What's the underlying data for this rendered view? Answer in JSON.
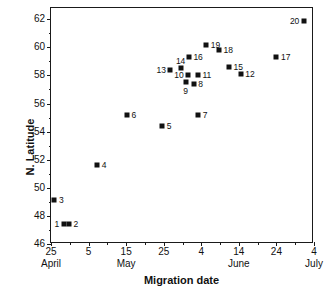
{
  "chart_data": {
    "type": "scatter",
    "title": "",
    "xlabel": "Migration date",
    "ylabel": "N. Latitude",
    "grid": false,
    "legend": false,
    "x_axis": {
      "ticks": [
        {
          "label": "25",
          "day": 25,
          "month": "April"
        },
        {
          "label": "5",
          "day": 35,
          "month": ""
        },
        {
          "label": "15",
          "day": 45,
          "month": "May"
        },
        {
          "label": "25",
          "day": 55,
          "month": ""
        },
        {
          "label": "4",
          "day": 65,
          "month": ""
        },
        {
          "label": "14",
          "day": 75,
          "month": "June"
        },
        {
          "label": "24",
          "day": 85,
          "month": ""
        },
        {
          "label": "4",
          "day": 95,
          "month": "July"
        }
      ],
      "months": [
        "April",
        "May",
        "June",
        "July"
      ],
      "range": [
        25,
        95
      ]
    },
    "y_axis": {
      "ticks": [
        "46",
        "48",
        "50",
        "52",
        "54",
        "56",
        "58",
        "60",
        "62"
      ],
      "range": [
        46,
        62.8
      ]
    },
    "points": [
      {
        "id": "1",
        "label": "1",
        "x": 28.4,
        "y": 47.4,
        "label_pos": "left"
      },
      {
        "id": "2",
        "label": "2",
        "x": 29.8,
        "y": 47.4,
        "label_pos": "right"
      },
      {
        "id": "3",
        "label": "3",
        "x": 25.9,
        "y": 49.1,
        "label_pos": "right"
      },
      {
        "id": "4",
        "label": "4",
        "x": 37.3,
        "y": 51.6,
        "label_pos": "right"
      },
      {
        "id": "5",
        "label": "5",
        "x": 54.6,
        "y": 54.4,
        "label_pos": "right"
      },
      {
        "id": "6",
        "label": "6",
        "x": 45.2,
        "y": 55.2,
        "label_pos": "right"
      },
      {
        "id": "7",
        "label": "7",
        "x": 64.2,
        "y": 55.2,
        "label_pos": "right"
      },
      {
        "id": "8",
        "label": "8",
        "x": 63.0,
        "y": 57.4,
        "label_pos": "right"
      },
      {
        "id": "9",
        "label": "9",
        "x": 60.8,
        "y": 57.5,
        "label_pos": "below"
      },
      {
        "id": "10",
        "label": "10",
        "x": 61.5,
        "y": 58.0,
        "label_pos": "left"
      },
      {
        "id": "11",
        "label": "11",
        "x": 64.1,
        "y": 58.0,
        "label_pos": "right"
      },
      {
        "id": "12",
        "label": "12",
        "x": 75.5,
        "y": 58.1,
        "label_pos": "right"
      },
      {
        "id": "13",
        "label": "13",
        "x": 56.8,
        "y": 58.4,
        "label_pos": "left"
      },
      {
        "id": "14",
        "label": "14",
        "x": 59.5,
        "y": 58.5,
        "label_pos": "above"
      },
      {
        "id": "15",
        "label": "15",
        "x": 72.4,
        "y": 58.6,
        "label_pos": "right"
      },
      {
        "id": "16",
        "label": "16",
        "x": 61.7,
        "y": 59.3,
        "label_pos": "right"
      },
      {
        "id": "17",
        "label": "17",
        "x": 85.0,
        "y": 59.3,
        "label_pos": "right"
      },
      {
        "id": "18",
        "label": "18",
        "x": 69.7,
        "y": 59.8,
        "label_pos": "right"
      },
      {
        "id": "19",
        "label": "19",
        "x": 66.3,
        "y": 60.2,
        "label_pos": "right"
      },
      {
        "id": "20",
        "label": "20",
        "x": 92.3,
        "y": 61.9,
        "label_pos": "left"
      }
    ]
  }
}
